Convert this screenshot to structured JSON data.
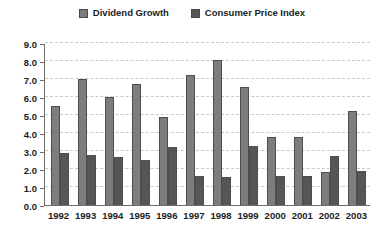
{
  "chart_data": {
    "type": "bar",
    "title": "",
    "subtitle": "",
    "xlabel": "",
    "ylabel": "",
    "ylim": [
      0.0,
      9.0
    ],
    "ytick_labels": [
      "9.0",
      "8.0",
      "7.0",
      "6.0",
      "5.0",
      "4.0",
      "3.0",
      "2.0",
      "1.0",
      "0.0"
    ],
    "ytick_values": [
      9.0,
      8.0,
      7.0,
      6.0,
      5.0,
      4.0,
      3.0,
      2.0,
      1.0,
      0.0
    ],
    "grid": "horizontal-dashed",
    "legend_position": "top-center",
    "categories": [
      "1992",
      "1993",
      "1994",
      "1995",
      "1996",
      "1997",
      "1998",
      "1999",
      "2000",
      "2001",
      "2002",
      "2003"
    ],
    "series": [
      {
        "name": "Dividend Growth",
        "color": "#7d7d7d",
        "values": [
          5.5,
          7.0,
          6.0,
          6.7,
          4.9,
          7.2,
          8.05,
          6.55,
          3.8,
          3.8,
          1.85,
          5.2
        ]
      },
      {
        "name": "Consumer Price Index",
        "color": "#565656",
        "values": [
          2.9,
          2.8,
          2.65,
          2.5,
          3.25,
          1.6,
          1.55,
          3.3,
          1.6,
          1.6,
          2.75,
          1.9
        ]
      }
    ]
  },
  "legend": {
    "entries": [
      {
        "label": "Dividend Growth",
        "color": "#7d7d7d"
      },
      {
        "label": "Consumer Price Index",
        "color": "#565656"
      }
    ]
  },
  "colors": {
    "series_a": "#7d7d7d",
    "series_b": "#565656",
    "axis": "#6d6d6d",
    "gridline": "#c9c9c9",
    "text": "#1c1c1c",
    "background": "#ffffff"
  }
}
